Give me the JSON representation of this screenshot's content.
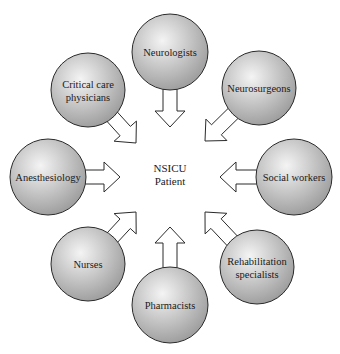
{
  "diagram": {
    "title": "",
    "center": {
      "lines": [
        "NSICU",
        "Patient"
      ],
      "x": 170,
      "y": 175
    },
    "colors": {
      "circle_light": "#f4f4f4",
      "circle_dark": "#9a9a9a",
      "stroke": "#2a2a2a",
      "arrow_fill": "#ffffff"
    },
    "nodes": [
      {
        "id": "neurologists",
        "lines": [
          "Neurologists"
        ],
        "cx": 170,
        "cy": 52,
        "r": 38,
        "tipx": 170,
        "tipy": 127
      },
      {
        "id": "neurosurgeons",
        "lines": [
          "Neurosurgeons"
        ],
        "cx": 259,
        "cy": 88,
        "r": 37,
        "tipx": 205,
        "tipy": 141
      },
      {
        "id": "social-workers",
        "lines": [
          "Social workers"
        ],
        "cx": 294,
        "cy": 177,
        "r": 38,
        "tipx": 220,
        "tipy": 177
      },
      {
        "id": "rehabilitation-specialists",
        "lines": [
          "Rehabilitation",
          "specialists"
        ],
        "cx": 257,
        "cy": 267,
        "r": 37,
        "tipx": 205,
        "tipy": 212
      },
      {
        "id": "pharmacists",
        "lines": [
          "Pharmacists"
        ],
        "cx": 170,
        "cy": 305,
        "r": 38,
        "tipx": 170,
        "tipy": 227
      },
      {
        "id": "nurses",
        "lines": [
          "Nurses"
        ],
        "cx": 88,
        "cy": 264,
        "r": 37,
        "tipx": 136,
        "tipy": 212
      },
      {
        "id": "anesthesiology",
        "lines": [
          "Anesthesiology"
        ],
        "cx": 48,
        "cy": 177,
        "r": 38,
        "tipx": 120,
        "tipy": 177
      },
      {
        "id": "critical-care-physicians",
        "lines": [
          "Critical care",
          "physicians"
        ],
        "cx": 88,
        "cy": 90,
        "r": 37,
        "tipx": 136,
        "tipy": 143
      }
    ]
  }
}
